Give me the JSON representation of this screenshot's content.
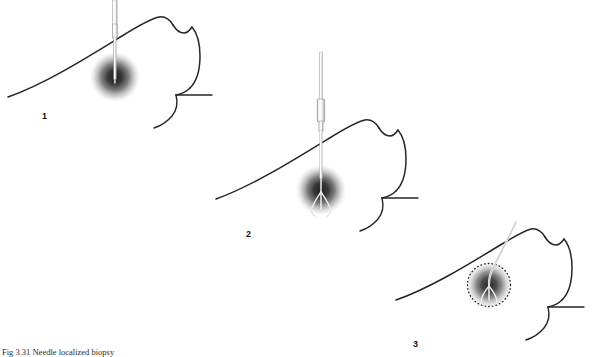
{
  "figure": {
    "caption": "Fig 3.31  Needle localized biopsy",
    "background_color": "#ffffff",
    "outline_color": "#262626",
    "lesion_color": "#1a1a1a",
    "instrument_color": "#bfbfbf",
    "panels": [
      {
        "number": "1",
        "title": "Needle inserted into breast lesion",
        "lesion": {
          "cx": 115,
          "cy": 77,
          "r": 26
        },
        "instrument": "needle",
        "marker_circle": false
      },
      {
        "number": "2",
        "title": "Hookwire advanced through needle into lesion",
        "lesion": {
          "cx": 321,
          "cy": 190,
          "r": 26
        },
        "instrument": "needle-with-hub-and-hookwire",
        "marker_circle": false
      },
      {
        "number": "3",
        "title": "Needle withdrawn leaving hookwire; excision margin marked",
        "lesion": {
          "cx": 489,
          "cy": 285,
          "r": 24
        },
        "instrument": "hookwire",
        "marker_circle": true
      }
    ]
  }
}
